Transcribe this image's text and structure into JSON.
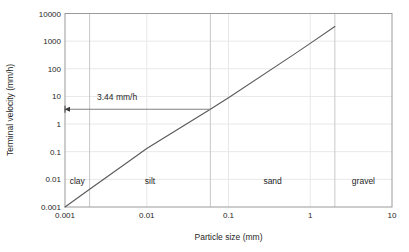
{
  "chart_data": {
    "type": "line",
    "title": "",
    "xlabel": "Particle size (mm)",
    "ylabel": "Terminal velocity (mm/h)",
    "xscale": "log",
    "yscale": "log",
    "xlim": [
      0.001,
      10
    ],
    "ylim": [
      0.001,
      10000
    ],
    "grid": true,
    "legend": "none",
    "xticks": [
      "0.001",
      "0.01",
      "0.1",
      "1",
      "10"
    ],
    "xtick_values": [
      0.001,
      0.01,
      0.1,
      1,
      10
    ],
    "yticks": [
      "10000",
      "1000",
      "100",
      "10",
      "1",
      "0.1",
      "0.01",
      "0.001"
    ],
    "ytick_values": [
      10000,
      1000,
      100,
      10,
      1,
      0.1,
      0.01,
      0.001
    ],
    "series": [
      {
        "name": "Terminal velocity",
        "x": [
          0.001,
          0.002,
          0.006,
          0.01,
          0.06,
          0.1,
          0.6,
          1,
          2
        ],
        "y": [
          0.001,
          0.0044,
          0.044,
          0.13,
          3.44,
          9.0,
          300,
          830,
          3400
        ],
        "color": "#595959"
      }
    ],
    "annotations": [
      {
        "name": "terminal-velocity-callout",
        "text": "3.44 mm/h",
        "value": 3.44,
        "units": "mm/h",
        "x_at": 0.06,
        "y_at": 3.44,
        "arrow": "left-to-axis"
      }
    ],
    "zones": [
      {
        "name": "clay",
        "label": "clay",
        "x_start": 0.001,
        "x_end": 0.002
      },
      {
        "name": "silt",
        "label": "silt",
        "x_start": 0.002,
        "x_end": 0.06
      },
      {
        "name": "sand",
        "label": "sand",
        "x_start": 0.06,
        "x_end": 2
      },
      {
        "name": "gravel",
        "label": "gravel",
        "x_start": 2,
        "x_end": 10
      }
    ],
    "zone_boundaries": [
      0.002,
      0.06,
      2
    ],
    "colors": {
      "series_line": "#595959",
      "gridline": "#e8e8e8",
      "axis": "#9a9a9a",
      "zone_divider": "#c8c8c8",
      "annotation": "#808080",
      "text": "#1f1f1f",
      "background": "#ffffff"
    }
  }
}
